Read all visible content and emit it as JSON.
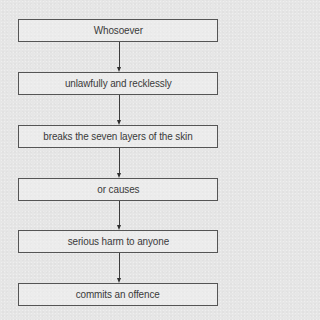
{
  "diagram": {
    "type": "flowchart",
    "direction": "top-to-bottom",
    "steps": [
      {
        "label": "Whosoever"
      },
      {
        "label": "unlawfully and recklessly"
      },
      {
        "label": "breaks the seven layers of the skin"
      },
      {
        "label": "or causes"
      },
      {
        "label": "serious harm to anyone"
      },
      {
        "label": "commits an offence"
      }
    ],
    "connectors": [
      {
        "from": 0,
        "to": 1
      },
      {
        "from": 1,
        "to": 2
      },
      {
        "from": 2,
        "to": 3
      },
      {
        "from": 3,
        "to": 4
      },
      {
        "from": 4,
        "to": 5
      }
    ]
  },
  "colors": {
    "background": "#e6e6e6",
    "box_border": "#555555",
    "text": "#3a3a3a",
    "arrow": "#2e2e2e"
  }
}
